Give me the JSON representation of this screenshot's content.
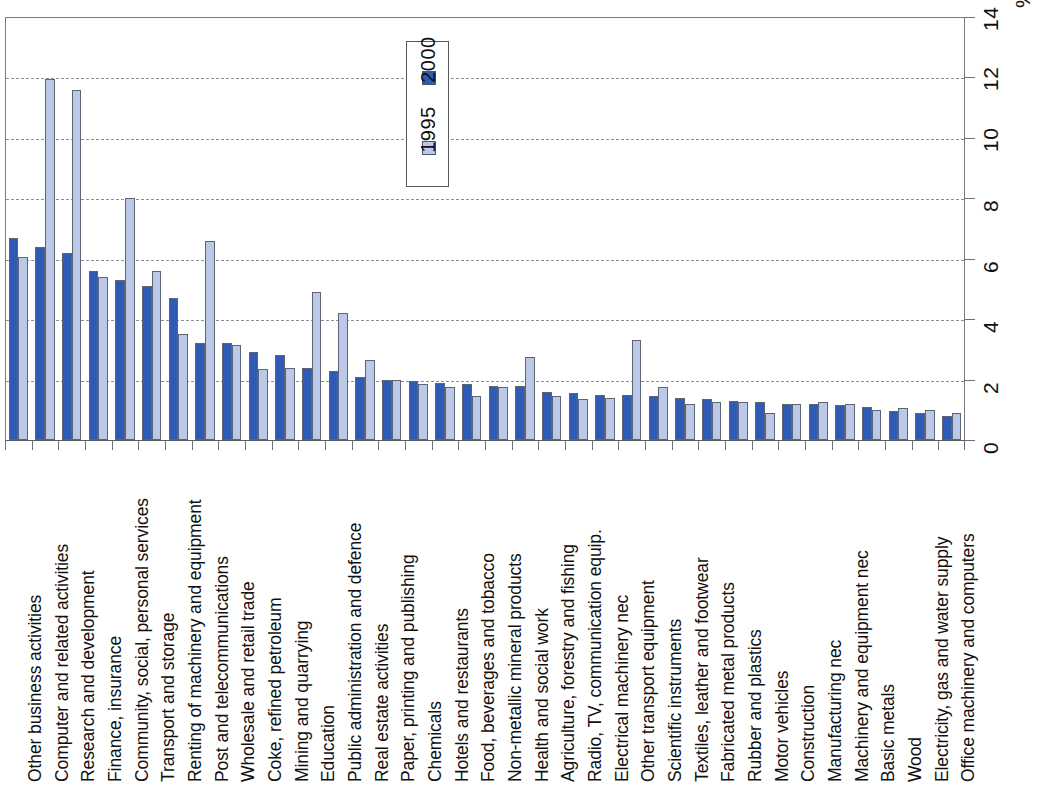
{
  "chart_data": {
    "type": "bar",
    "title": "",
    "subtitle": "",
    "xlabel": "",
    "ylabel": "%",
    "ylim": [
      0,
      14
    ],
    "ytick_labels": [
      "0",
      "2",
      "4",
      "6",
      "8",
      "10",
      "12",
      "14"
    ],
    "ytick_values": [
      0,
      2,
      4,
      6,
      8,
      10,
      12,
      14
    ],
    "grid": "horizontal-dashed",
    "legend_position": "top-center",
    "orientation": "vertical-bars-with-rotated-category-labels",
    "unit_symbol": "%",
    "categories": [
      "Other business activities",
      "Computer and related activities",
      "Research and development",
      "Finance, insurance",
      "Community, social, personal services",
      "Transport and storage",
      "Renting of machinery and equipment",
      "Post and telecommunications",
      "Wholesale and retail trade",
      "Coke, refined petroleum",
      "Mining and quarrying",
      "Education",
      "Public administration and defence",
      "Real estate activities",
      "Paper, printing and publishing",
      "Chemicals",
      "Hotels and restaurants",
      "Food, beverages and tobacco",
      "Non-metallic mineral products",
      "Health and social work",
      "Agriculture, forestry and fishing",
      "Radio, TV, communication equip.",
      "Electrical machinery nec",
      "Other transport equipment",
      "Scientific instruments",
      "Textiles, leather and footwear",
      "Fabricated metal products",
      "Rubber and plastics",
      "Motor vehicles",
      "Construction",
      "Manufacturing nec",
      "Machinery and equipment nec",
      "Basic metals",
      "Wood",
      "Electricity, gas and water supply",
      "Office machinery and computers"
    ],
    "series": [
      {
        "name": "2000",
        "color": "#2f5bb5",
        "values": [
          6.7,
          6.4,
          6.2,
          5.6,
          5.3,
          5.1,
          4.7,
          3.2,
          3.2,
          2.9,
          2.8,
          2.4,
          2.3,
          2.1,
          2.0,
          1.95,
          1.9,
          1.85,
          1.8,
          1.8,
          1.6,
          1.55,
          1.5,
          1.5,
          1.45,
          1.4,
          1.35,
          1.3,
          1.25,
          1.2,
          1.2,
          1.15,
          1.1,
          0.95,
          0.9,
          0.8
        ]
      },
      {
        "name": "1995",
        "color": "#bcc8e8",
        "values": [
          6.05,
          11.95,
          11.6,
          5.4,
          8.0,
          5.6,
          3.5,
          6.6,
          3.15,
          2.35,
          2.4,
          4.9,
          4.2,
          2.65,
          2.0,
          1.85,
          1.75,
          1.45,
          1.75,
          2.75,
          1.45,
          1.35,
          1.4,
          3.3,
          1.75,
          1.2,
          1.25,
          1.25,
          0.9,
          1.2,
          1.25,
          1.2,
          1.0,
          1.05,
          1.0,
          0.9
        ]
      }
    ]
  },
  "legend": {
    "entries": [
      {
        "label": "2000",
        "swatch": "s2000"
      },
      {
        "label": "1995",
        "swatch": "s1995"
      }
    ]
  }
}
